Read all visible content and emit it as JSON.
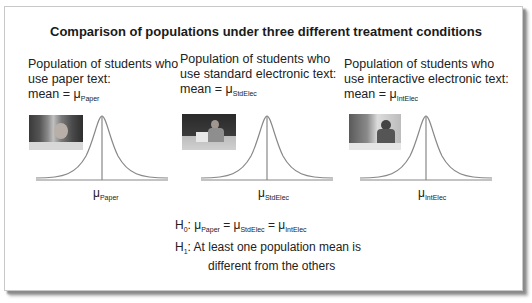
{
  "title": "Comparison of populations under three different treatment conditions",
  "populations": [
    {
      "line1": "Population of students who",
      "line2": "use paper text:",
      "mean_prefix": "mean = μ",
      "mean_sub": "Paper",
      "axis_mu": "μ",
      "axis_sub": "Paper",
      "photo": "student-reading-paper-photo"
    },
    {
      "line1": "Population of students who",
      "line2": "use standard electronic text:",
      "mean_prefix": "mean = μ",
      "mean_sub": "StdElec",
      "axis_mu": "μ",
      "axis_sub": "StdElec",
      "photo": "student-using-laptop-photo"
    },
    {
      "line1": "Population of students who",
      "line2": "use interactive electronic text:",
      "mean_prefix": "mean = μ",
      "mean_sub": "IntElec",
      "axis_mu": "μ",
      "axis_sub": "IntElec",
      "photo": "student-interactive-computer-photo"
    }
  ],
  "hypotheses": {
    "h0_label": "H",
    "h0_sub": "0",
    "h0_text_a": ": μ",
    "h0_s1": "Paper",
    "h0_text_b": " = μ",
    "h0_s2": "StdElec",
    "h0_text_c": " = μ",
    "h0_s3": "IntElec",
    "h1_label": "H",
    "h1_sub": "1",
    "h1_line1": ": At least one population mean is",
    "h1_line2": "different from the others"
  },
  "colors": {
    "curve": "#888888",
    "text": "#222222",
    "frame_shadow": "#8a8a8a"
  }
}
